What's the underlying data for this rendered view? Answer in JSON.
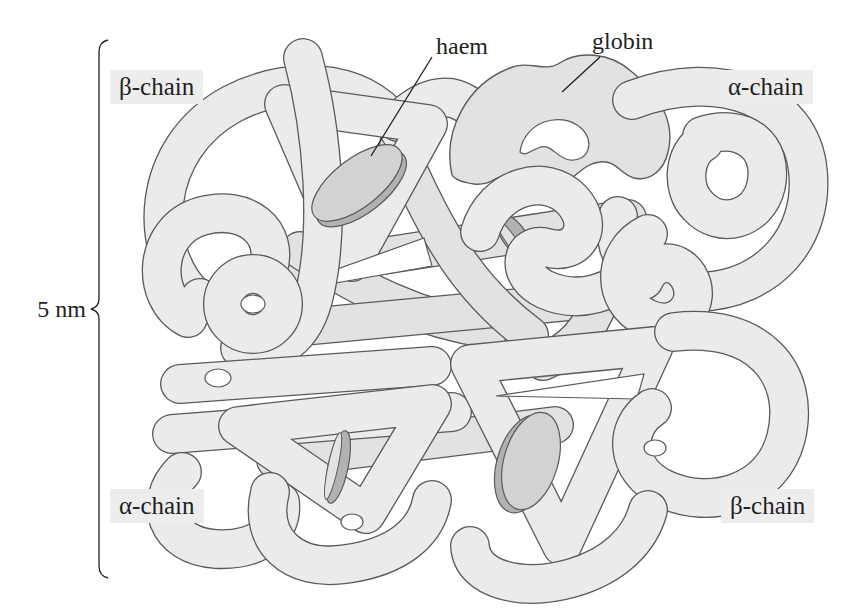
{
  "labels": {
    "chain_top_left": "β-chain",
    "chain_top_right": "α-chain",
    "chain_bottom_left": "α-chain",
    "chain_bottom_right": "β-chain",
    "haem": "haem",
    "globin": "globin",
    "scale": "5 nm"
  },
  "icons": {
    "scale_bracket": "curly-brace-left",
    "haem_disc": "tilted-grey-disc",
    "globin_tube": "light-grey-folded-tube"
  },
  "counts_visible": {
    "haem_discs": 4,
    "chain_labels": 4
  },
  "colors": {
    "background": "#ffffff",
    "tube_fill": "#ebebeb",
    "tube_fill_alt": "#e2e2e2",
    "outline": "#5a5a5a",
    "ink": "#1f1f1f",
    "label_bg": "#ededed",
    "haem_face": "#d2d2d2",
    "haem_rim": "#b2b2b2",
    "haem_sliver": "#e3e3e3"
  }
}
